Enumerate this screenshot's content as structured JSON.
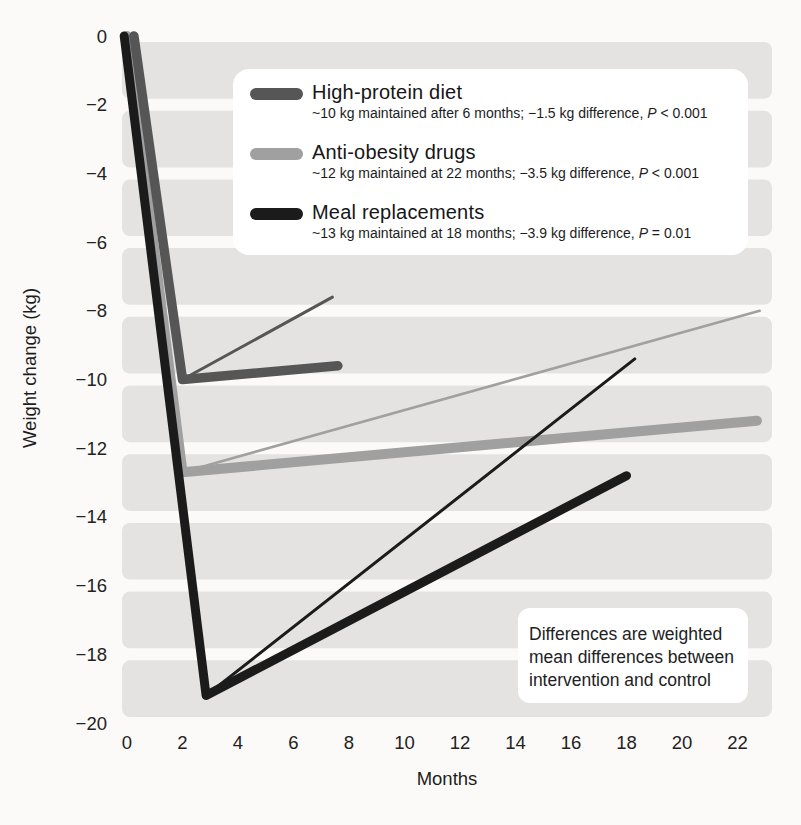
{
  "style": {
    "page_background": "#fbfaf8",
    "band_color": "#e4e3e1",
    "box_background": "#ffffff",
    "text_color": "#1d1d1d"
  },
  "y_axis": {
    "title": "Weight change (kg)",
    "tick_values": [
      0,
      -2,
      -4,
      -6,
      -8,
      -10,
      -12,
      -14,
      -16,
      -18,
      -20
    ],
    "tick_labels": [
      "0",
      "−2",
      "−4",
      "−6",
      "−8",
      "−10",
      "−12",
      "−14",
      "−16",
      "−18",
      "−20"
    ]
  },
  "x_axis": {
    "title": "Months",
    "tick_values": [
      0,
      2,
      4,
      6,
      8,
      10,
      12,
      14,
      16,
      18,
      20,
      22
    ],
    "tick_labels": [
      "0",
      "2",
      "4",
      "6",
      "8",
      "10",
      "12",
      "14",
      "16",
      "18",
      "20",
      "22"
    ]
  },
  "legend": {
    "items": [
      {
        "label": "High-protein diet",
        "detail": "~10 kg maintained after 6 months; −1.5 kg difference, ",
        "p_symbol": "P",
        "p_value": " < 0.001",
        "color": "#565656"
      },
      {
        "label": "Anti-obesity drugs",
        "detail": "~12 kg maintained at 22 months; −3.5 kg difference, ",
        "p_symbol": "P",
        "p_value": " < 0.001",
        "color": "#a0a0a0"
      },
      {
        "label": "Meal replacements",
        "detail": "~13 kg maintained at 18 months; −3.9 kg difference, ",
        "p_symbol": "P",
        "p_value": " = 0.01",
        "color": "#1b1b1b"
      }
    ]
  },
  "note": {
    "lines": [
      "Differences are weighted",
      "mean differences between",
      "intervention and control"
    ]
  },
  "chart_data": {
    "type": "line",
    "title": "",
    "xlabel": "Months",
    "ylabel": "Weight change (kg)",
    "xlim": [
      0,
      23.5
    ],
    "ylim": [
      -20,
      0
    ],
    "x_ticks": [
      0,
      2,
      4,
      6,
      8,
      10,
      12,
      14,
      16,
      18,
      20,
      22
    ],
    "y_ticks": [
      0,
      -2,
      -4,
      -6,
      -8,
      -10,
      -12,
      -14,
      -16,
      -18,
      -20
    ],
    "grid": "shaded horizontal bands every 2 kg, white gaps at tick lines",
    "legend_position": "inset box, upper center",
    "annotation": "Differences are weighted mean differences between intervention and control",
    "series": [
      {
        "name": "Anti-obesity drugs",
        "variant": "intervention (thick)",
        "color": "#a0a0a0",
        "stroke_width": 10,
        "points": [
          [
            0,
            0
          ],
          [
            2,
            -12.7
          ],
          [
            22.7,
            -11.2
          ]
        ]
      },
      {
        "name": "Anti-obesity drugs",
        "variant": "comparator (thin)",
        "color": "#a0a0a0",
        "stroke_width": 2.6,
        "points": [
          [
            2,
            -12.7
          ],
          [
            22.8,
            -8.0
          ]
        ]
      },
      {
        "name": "High-protein diet",
        "variant": "intervention (thick)",
        "color": "#565656",
        "stroke_width": 9.5,
        "points": [
          [
            0.25,
            0
          ],
          [
            2,
            -10.0
          ],
          [
            7.6,
            -9.6
          ]
        ]
      },
      {
        "name": "High-protein diet",
        "variant": "comparator (thin)",
        "color": "#565656",
        "stroke_width": 3,
        "points": [
          [
            2,
            -10.0
          ],
          [
            7.4,
            -7.6
          ]
        ]
      },
      {
        "name": "Meal replacements",
        "variant": "intervention (thick)",
        "color": "#1b1b1b",
        "stroke_width": 9,
        "points": [
          [
            -0.1,
            0
          ],
          [
            2.85,
            -19.2
          ],
          [
            18,
            -12.8
          ]
        ]
      },
      {
        "name": "Meal replacements",
        "variant": "comparator (thin)",
        "color": "#1b1b1b",
        "stroke_width": 3,
        "points": [
          [
            2.85,
            -19.2
          ],
          [
            18.3,
            -9.4
          ]
        ]
      }
    ]
  }
}
